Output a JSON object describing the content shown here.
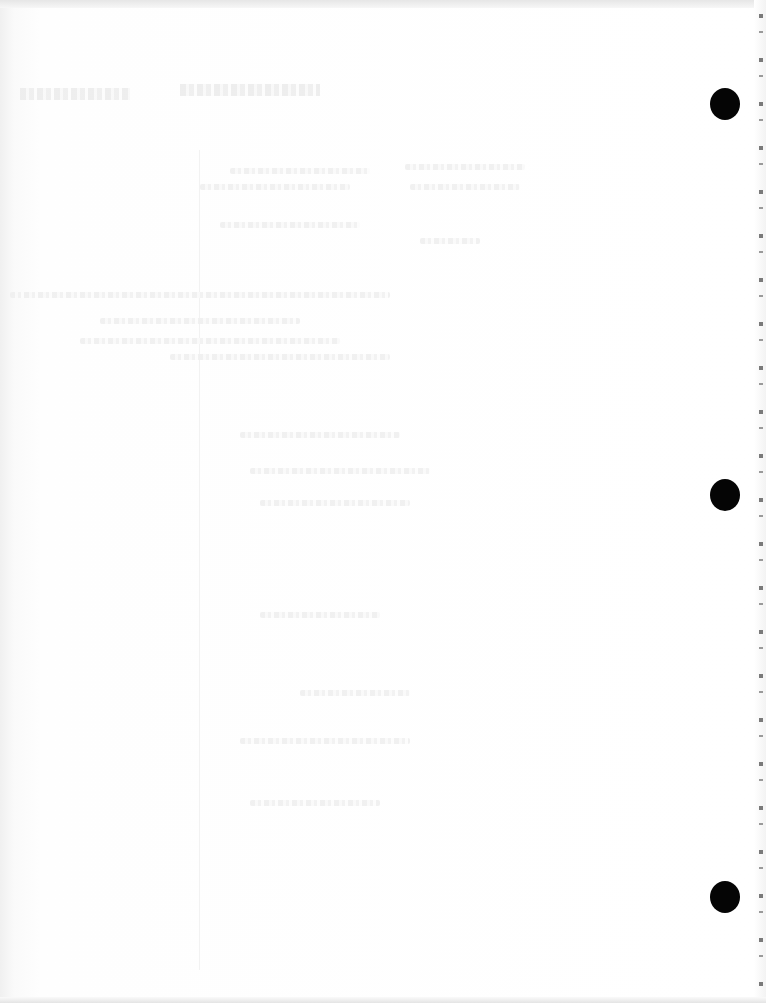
{
  "document": {
    "type": "scanned-page",
    "visible_text": "",
    "bleed_through_text_legible": false,
    "paper_color": "#ffffff",
    "hole_color": "#050505"
  },
  "punch_holes": [
    {
      "cx": 725,
      "cy": 104
    },
    {
      "cx": 725,
      "cy": 495
    },
    {
      "cx": 725,
      "cy": 897
    }
  ]
}
